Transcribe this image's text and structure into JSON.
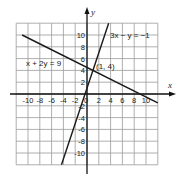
{
  "chart_data": {
    "type": "line",
    "title": "",
    "xlabel": "x",
    "ylabel": "y",
    "xlim": [
      -12,
      12
    ],
    "ylim": [
      -12,
      12
    ],
    "grid": true,
    "grid_step": 2,
    "x_ticks": [
      -10,
      -8,
      -6,
      -4,
      -2,
      0,
      2,
      4,
      6,
      8,
      10
    ],
    "y_ticks": [
      -10,
      -8,
      -6,
      -4,
      -2,
      2,
      4,
      6,
      8,
      10
    ],
    "series": [
      {
        "name": "x + 2y = 9",
        "equation": "x + 2y = 9",
        "points": [
          [
            -11,
            10
          ],
          [
            12,
            -1.5
          ]
        ]
      },
      {
        "name": "3x − y = −1",
        "equation": "3x - y = -1",
        "points": [
          [
            -4.33,
            -12
          ],
          [
            3.67,
            12
          ]
        ]
      }
    ],
    "annotations": [
      {
        "text": "(1, 4)",
        "x": 1,
        "y": 4,
        "type": "intersection"
      },
      {
        "text": "x + 2y = 9",
        "label_for": "x + 2y = 9"
      },
      {
        "text": "3x − y = −1",
        "label_for": "3x − y = −1"
      }
    ]
  },
  "labels": {
    "x_axis": "x",
    "y_axis": "y",
    "eq1": "x + 2y = 9",
    "eq2": "3x − y = −1",
    "point": "(1, 4)"
  },
  "colors": {
    "grid": "#9a9a9a",
    "axis": "#111111",
    "line": "#1a1a1a"
  }
}
